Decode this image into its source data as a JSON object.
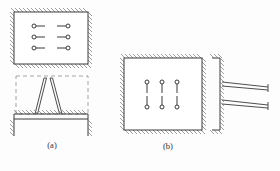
{
  "figure": {
    "title": "",
    "background_color": "#fdfdfd",
    "line_color": "#3a3a3a",
    "hatch_color": "#6e6e6e",
    "dash_color": "#9a9a9a",
    "width": 280,
    "height": 171
  },
  "panels": [
    {
      "id": "a",
      "caption": "(a)",
      "description": "horizontal mount arrangement with dashed reference frame and A-frame brace on hatched support beam",
      "enclosure": {
        "name": "hatched-enclosure-a",
        "x": 14,
        "y": 12,
        "width": 74,
        "height": 52,
        "hatched_sides": [
          "top",
          "right",
          "bottom",
          "left"
        ]
      },
      "mount_symbols": {
        "name": "horizontal-mount-pairs",
        "orientation": "horizontal",
        "rows": 3,
        "columns": 2,
        "count": 6,
        "circle_radius": 2.0,
        "stub_length": 9,
        "row_y": [
          26,
          37,
          48
        ],
        "left_circle_x": 34,
        "right_circle_x": 68
      },
      "dashed_frame": {
        "name": "dashed-reference-frame",
        "x": 16,
        "y": 76,
        "width": 72,
        "height": 38
      },
      "brace": {
        "name": "a-frame-brace",
        "type": "double-line-legs",
        "legs": 2,
        "apex_left_x": 44,
        "apex_right_x": 52,
        "apex_y": 78,
        "base_left_x": 35,
        "base_right_x": 62,
        "base_y": 114
      },
      "support_beam": {
        "name": "hatched-support-beam",
        "x": 14,
        "y": 114,
        "width": 74,
        "height": 5,
        "hatch_on": "top"
      },
      "end_posts": {
        "name": "vertical-end-posts",
        "count": 2,
        "left_x": 14,
        "right_x": 88,
        "top_y": 119,
        "bottom_y": 136
      }
    },
    {
      "id": "b",
      "caption": "(b)",
      "description": "vertical mount arrangement in hatched enclosure beside cantilever wall with two tapered bars",
      "enclosure": {
        "name": "hatched-enclosure-b",
        "x": 124,
        "y": 58,
        "width": 78,
        "height": 72,
        "hatched_sides": [
          "top",
          "right",
          "bottom",
          "left"
        ]
      },
      "mount_symbols": {
        "name": "vertical-mount-pairs",
        "orientation": "vertical",
        "rows": 2,
        "columns": 3,
        "count": 6,
        "circle_radius": 2.0,
        "stub_length": 9,
        "column_x": [
          147,
          162,
          177
        ],
        "top_circle_y": 82,
        "bottom_circle_y": 107
      },
      "wall": {
        "name": "cantilever-wall",
        "x": 220,
        "y": 58,
        "height": 72,
        "thickness": 3,
        "hatch_on": "right",
        "foot_top": {
          "x": 212,
          "y": 58,
          "width": 10
        },
        "foot_bottom": {
          "x": 212,
          "y": 130,
          "width": 10
        }
      },
      "cantilever_bars": {
        "name": "tapered-cantilever-bars",
        "count": 2,
        "root_x": 222,
        "tip_x": 268,
        "bars": [
          {
            "root_top_y": 82,
            "root_bottom_y": 86,
            "tip_y": 88
          },
          {
            "root_top_y": 100,
            "root_bottom_y": 104,
            "tip_y": 106
          }
        ],
        "end_cap_length": 7
      }
    }
  ]
}
